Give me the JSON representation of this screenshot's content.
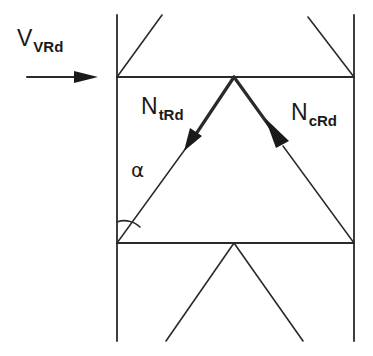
{
  "diagram": {
    "colors": {
      "line": "#2a2a2a",
      "background": "#ffffff"
    },
    "labels": {
      "shear": {
        "main": "V",
        "sub": "VRd"
      },
      "tension": {
        "main": "N",
        "sub": "tRd"
      },
      "compression": {
        "main": "N",
        "sub": "cRd"
      },
      "angle": "α"
    },
    "geometry": {
      "left_chord_x": 117,
      "right_chord_x": 354,
      "top_horizontal_y": 77,
      "bottom_horizontal_y": 243,
      "apex_top": [
        234,
        77
      ],
      "apex_bottom": [
        234,
        243
      ],
      "chord_top_y": 15,
      "chord_bottom_y": 341
    }
  }
}
